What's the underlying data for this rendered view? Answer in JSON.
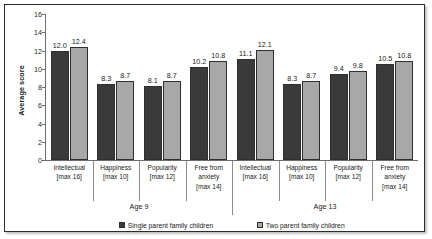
{
  "chart_data": {
    "type": "bar",
    "title": "",
    "xlabel": "",
    "ylabel": "Average score",
    "ylim": [
      0,
      16
    ],
    "ytick_step": 2,
    "yticks": [
      16,
      14,
      12,
      10,
      8,
      6,
      4,
      2,
      0
    ],
    "grid": false,
    "legend_position": "bottom",
    "groups": [
      {
        "name": "Age 9",
        "categories": [
          {
            "line1": "Intellectual",
            "line2": "[max 16]",
            "line3": ""
          },
          {
            "line1": "Happiness",
            "line2": "[max 10]",
            "line3": ""
          },
          {
            "line1": "Popularity",
            "line2": "[max 12]",
            "line3": ""
          },
          {
            "line1": "Free from",
            "line2": "anxiety",
            "line3": "[max 14]"
          }
        ]
      },
      {
        "name": "Age 13",
        "categories": [
          {
            "line1": "Intellectual",
            "line2": "[max 16]",
            "line3": ""
          },
          {
            "line1": "Happiness",
            "line2": "[max 10]",
            "line3": ""
          },
          {
            "line1": "Popularity",
            "line2": "[max 12]",
            "line3": ""
          },
          {
            "line1": "Free from",
            "line2": "anxiety",
            "line3": "[max 14]"
          }
        ]
      }
    ],
    "categories": [
      "Intellectual [max 16] (Age 9)",
      "Happiness [max 10] (Age 9)",
      "Popularity [max 12] (Age 9)",
      "Free from anxiety [max 14] (Age 9)",
      "Intellectual [max 16] (Age 13)",
      "Happiness [max 10] (Age 13)",
      "Popularity [max 12] (Age 13)",
      "Free from anxiety [max 14] (Age 13)"
    ],
    "series": [
      {
        "name": "Single parent family children",
        "color": "#3a3a3a",
        "values": [
          12.0,
          8.3,
          8.1,
          10.2,
          11.1,
          8.3,
          9.4,
          10.5
        ],
        "labels": [
          "12.0",
          "8.3",
          "8.1",
          "10.2",
          "11.1",
          "8.3",
          "9.4",
          "10.5"
        ]
      },
      {
        "name": "Two parent family children",
        "color": "#a8a8a8",
        "values": [
          12.4,
          8.7,
          8.7,
          10.8,
          12.1,
          8.7,
          9.8,
          10.8
        ],
        "labels": [
          "12.4",
          "8.7",
          "8.7",
          "10.8",
          "12.1",
          "8.7",
          "9.8",
          "10.8"
        ]
      }
    ]
  },
  "legend": {
    "items": [
      {
        "label": "Single parent family children",
        "swatch": "single"
      },
      {
        "label": "Two parent family children",
        "swatch": "two"
      }
    ]
  }
}
